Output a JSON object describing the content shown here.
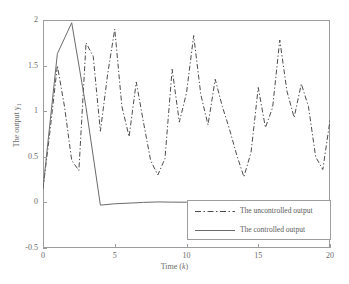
{
  "chart_data": {
    "type": "line",
    "title": "",
    "xlabel": "Time (k)",
    "ylabel": "The output y",
    "ylabel_subscript": "1",
    "xlim": [
      0,
      20
    ],
    "ylim": [
      -0.5,
      2
    ],
    "xticks": [
      "0",
      "5",
      "10",
      "15",
      "20"
    ],
    "xtick_values": [
      0,
      5,
      10,
      15,
      20
    ],
    "yticks": [
      "-0.5",
      "0",
      "0.5",
      "1",
      "1.5",
      "2"
    ],
    "ytick_values": [
      -0.5,
      0,
      0.5,
      1,
      1.5,
      2
    ],
    "grid": false,
    "legend_position": "lower right",
    "x": [
      0,
      1,
      2,
      3,
      4,
      5,
      6,
      7,
      8,
      9,
      10,
      11,
      12,
      13,
      14,
      15,
      16,
      17,
      18,
      19,
      20
    ],
    "series": [
      {
        "name": "The uncontrolled output",
        "style": "dash-dot",
        "color": "#4d4d4d",
        "x": [
          0,
          0.5,
          1,
          1.5,
          2,
          2.5,
          3,
          3.5,
          4,
          4.5,
          5,
          5.5,
          6,
          6.5,
          7,
          7.5,
          8,
          8.5,
          9,
          9.5,
          10,
          10.5,
          11,
          11.5,
          12,
          12.5,
          13,
          13.5,
          14,
          14.5,
          15,
          15.5,
          16,
          16.5,
          17,
          17.5,
          18,
          18.5,
          19,
          19.5,
          20
        ],
        "values": [
          0.15,
          0.8,
          1.5,
          1.05,
          0.46,
          0.35,
          1.75,
          1.6,
          0.78,
          1.4,
          1.9,
          1.05,
          0.72,
          1.32,
          0.88,
          0.46,
          0.3,
          0.48,
          1.46,
          0.88,
          1.2,
          1.83,
          1.18,
          0.85,
          1.35,
          1.05,
          0.8,
          0.52,
          0.28,
          0.55,
          1.26,
          0.82,
          1.04,
          1.78,
          1.22,
          0.93,
          1.3,
          1.05,
          0.5,
          0.36,
          0.9
        ]
      },
      {
        "name": "The controlled output",
        "style": "solid",
        "color": "#6b6b6b",
        "x": [
          0,
          1,
          2,
          3,
          4,
          5,
          6,
          7,
          8,
          9,
          10,
          11,
          12,
          13,
          14,
          15,
          16,
          17,
          18,
          19,
          20
        ],
        "values": [
          0.15,
          1.63,
          1.97,
          1.04,
          -0.03,
          -0.015,
          -0.008,
          0.0,
          0.005,
          0.003,
          0.002,
          0.004,
          0.003,
          0.005,
          0.006,
          0.006,
          0.007,
          0.008,
          0.01,
          0.014,
          0.022
        ]
      }
    ]
  },
  "legend": {
    "items": [
      {
        "label": "The uncontrolled output",
        "style": "dash-dot"
      },
      {
        "label": "The controlled output",
        "style": "solid"
      }
    ]
  },
  "colors": {
    "axis": "#9d9d9d",
    "text": "#6b6b6b",
    "uncontrolled": "#4d4d4d",
    "controlled": "#6b6b6b",
    "background": "#ffffff"
  }
}
